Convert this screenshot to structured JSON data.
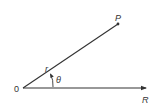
{
  "diagram": {
    "type": "polar-coordinates",
    "labels": {
      "origin": "0",
      "point": "P",
      "radius": "r",
      "angle": "θ",
      "axis": "R"
    },
    "colors": {
      "line": "#333333",
      "background": "#ffffff"
    }
  }
}
